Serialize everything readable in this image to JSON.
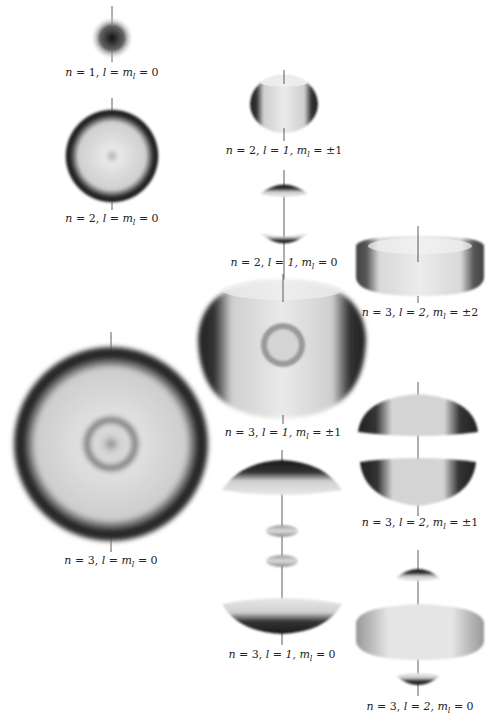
{
  "orbitals": [
    {
      "id": "1s",
      "n": 1,
      "l": 0,
      "ml": "0",
      "label": {
        "n": "1",
        "l": "l = m",
        "ml_sub": "l",
        "ml": " = 0"
      }
    },
    {
      "id": "2s",
      "n": 2,
      "l": 0,
      "ml": "0",
      "label": {
        "n": "2",
        "l": "l = m",
        "ml_sub": "l",
        "ml": " = 0"
      }
    },
    {
      "id": "2p1",
      "n": 2,
      "l": 1,
      "ml": "±1",
      "label": {
        "n": "2",
        "l": "l = 1, m",
        "ml_sub": "l",
        "ml": " = ±1"
      }
    },
    {
      "id": "2p0",
      "n": 2,
      "l": 1,
      "ml": "0",
      "label": {
        "n": "2",
        "l": "l = 1, m",
        "ml_sub": "l",
        "ml": " = 0"
      }
    },
    {
      "id": "3d2",
      "n": 3,
      "l": 2,
      "ml": "±2",
      "label": {
        "n": "3",
        "l": "l = 2, m",
        "ml_sub": "l",
        "ml": " = ±2"
      }
    },
    {
      "id": "3p1",
      "n": 3,
      "l": 1,
      "ml": "±1",
      "label": {
        "n": "3",
        "l": "l = 1, m",
        "ml_sub": "l",
        "ml": " = ±1"
      }
    },
    {
      "id": "3s",
      "n": 3,
      "l": 0,
      "ml": "0",
      "label": {
        "n": "3",
        "l": "l = m",
        "ml_sub": "l",
        "ml": " = 0"
      }
    },
    {
      "id": "3d1",
      "n": 3,
      "l": 2,
      "ml": "±1",
      "label": {
        "n": "3",
        "l": "l = 2, m",
        "ml_sub": "l",
        "ml": " = ±1"
      }
    },
    {
      "id": "3p0",
      "n": 3,
      "l": 1,
      "ml": "0",
      "label": {
        "n": "3",
        "l": "l = 1, m",
        "ml_sub": "l",
        "ml": " = 0"
      }
    },
    {
      "id": "3d0",
      "n": 3,
      "l": 2,
      "ml": "0",
      "label": {
        "n": "3",
        "l": "l = 2, m",
        "ml_sub": "l",
        "ml": " = 0"
      }
    }
  ],
  "colors": {
    "dark": "#1a1a1a",
    "mid": "#8a8a8a",
    "light": "#e6e6e6",
    "axis": "#333333"
  }
}
